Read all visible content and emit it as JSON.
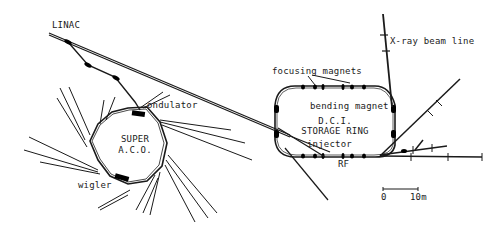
{
  "labels": {
    "linac": "LINAC",
    "ondulator": "ondulator",
    "super_aco_line1": "SUPER",
    "super_aco_line2": "A.C.O.",
    "wiggler": "wigler",
    "focusing_magnets": "focusing magnets",
    "bending_magnet": "bending magnet",
    "dci_line1": "D.C.I.",
    "dci_line2": "STORAGE RING",
    "injector": "injector",
    "rf": "RF",
    "xray_beam_line": "X-ray beam line"
  },
  "scale_bar": {
    "start_label": "0",
    "end_label": "10m"
  },
  "colors": {
    "ink": "#1a1a1a",
    "background": "#ffffff"
  }
}
